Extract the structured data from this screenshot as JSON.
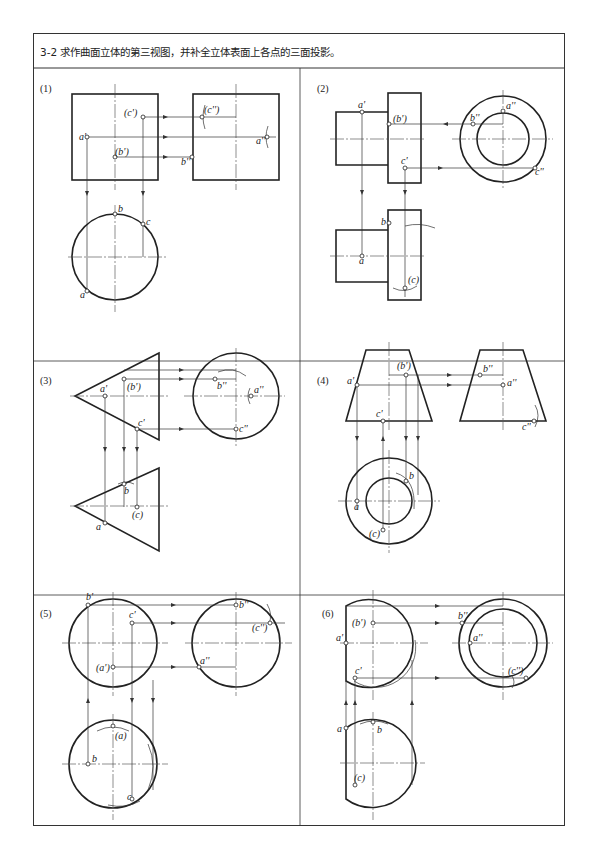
{
  "header": {
    "title": "3-2 求作曲面立体的第三视图，并补全立体表面上各点的三面投影。"
  },
  "panels": [
    {
      "id": "1",
      "label": "(1)",
      "points": [
        "a'",
        "(b')",
        "(c')",
        "a''",
        "b''",
        "(c'')",
        "a",
        "b",
        "c"
      ]
    },
    {
      "id": "2",
      "label": "(2)",
      "points": [
        "a'",
        "(b')",
        "c'",
        "a''",
        "b''",
        "c''",
        "a",
        "b",
        "(c)"
      ]
    },
    {
      "id": "3",
      "label": "(3)",
      "points": [
        "a'",
        "(b')",
        "c'",
        "a''",
        "b''",
        "c''",
        "a",
        "b",
        "(c)"
      ]
    },
    {
      "id": "4",
      "label": "(4)",
      "points": [
        "a'",
        "(b')",
        "c'",
        "a''",
        "b''",
        "c''",
        "a",
        "b",
        "(c)"
      ]
    },
    {
      "id": "5",
      "label": "(5)",
      "points": [
        "b'",
        "c'",
        "(a')",
        "b''",
        "(c'')",
        "a''",
        "(a)",
        "b",
        "c"
      ]
    },
    {
      "id": "6",
      "label": "(6)",
      "points": [
        "(b')",
        "a'",
        "c'",
        "b''",
        "a''",
        "(c'')",
        "a",
        "b",
        "(c)"
      ]
    }
  ]
}
